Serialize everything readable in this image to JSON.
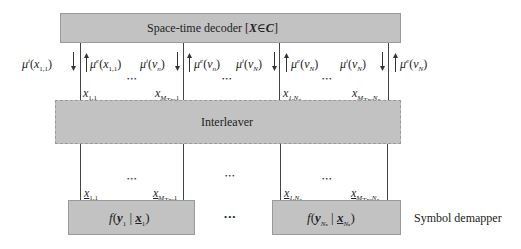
{
  "decoder": {
    "label_prefix": "Space-time decoder [",
    "label_var": "X",
    "label_in": "∈",
    "label_set": "C",
    "label_suffix": "]"
  },
  "interleaver": {
    "label": "Interleaver"
  },
  "demapper": {
    "side_label": "Symbol demapper",
    "left_formula": {
      "fn": "f",
      "y": "y",
      "y_sub": "1",
      "x": "x",
      "x_sub": "1"
    },
    "right_formula": {
      "fn": "f",
      "y": "y",
      "y_sub": "Nₛ",
      "x": "x",
      "x_sub": "Nₛ"
    },
    "between_dots": "•••"
  },
  "messages": {
    "m1": {
      "mu": "μ",
      "sup": "i",
      "arg": "x",
      "sub": "1,1",
      "direction": "down"
    },
    "m2": {
      "mu": "μ",
      "sup": "e",
      "arg": "x",
      "sub": "1,1",
      "direction": "up"
    },
    "m3": {
      "mu": "μ",
      "sup": "i",
      "arg": "v",
      "sub": "n",
      "direction": "down"
    },
    "m4": {
      "mu": "μ",
      "sup": "e",
      "arg": "v",
      "sub": "n",
      "direction": "up"
    },
    "m5": {
      "mu": "μ",
      "sup": "i",
      "arg": "v",
      "sub": "N",
      "direction": "down"
    },
    "m6": {
      "mu": "μ",
      "sup": "e",
      "arg": "v",
      "sub": "N",
      "direction": "up"
    },
    "m7": {
      "mu": "μ",
      "sup": "i",
      "arg": "v",
      "sub": "N",
      "direction": "down"
    },
    "m8": {
      "mu": "μ",
      "sup": "e",
      "arg": "v",
      "sub": "N",
      "direction": "up"
    }
  },
  "upper_symbols": {
    "s1": {
      "var": "x",
      "sub": "1,1"
    },
    "s2": {
      "var": "x",
      "sub": "M",
      "subsub": "Tx",
      "tail": ",1"
    },
    "s3": {
      "var": "x",
      "sub": "1,N",
      "subsub": "s"
    },
    "s4": {
      "var": "x",
      "sub": "M",
      "subsub": "Tx",
      "tail": ",N",
      "tail_sub": "s"
    }
  },
  "lower_symbols": {
    "s1": {
      "var": "x",
      "sub": "1,1"
    },
    "s2": {
      "var": "x",
      "sub": "M",
      "subsub": "Tx",
      "tail": ",1"
    },
    "s3": {
      "var": "x",
      "sub": "1,N",
      "subsub": "s"
    },
    "s4": {
      "var": "x",
      "sub": "M",
      "subsub": "Tx",
      "tail": ",N",
      "tail_sub": "s"
    }
  },
  "ellipsis": "•••",
  "colors": {
    "box_fill": "#c2c2c2",
    "box_border": "#9a9a9a",
    "line": "#444444"
  }
}
